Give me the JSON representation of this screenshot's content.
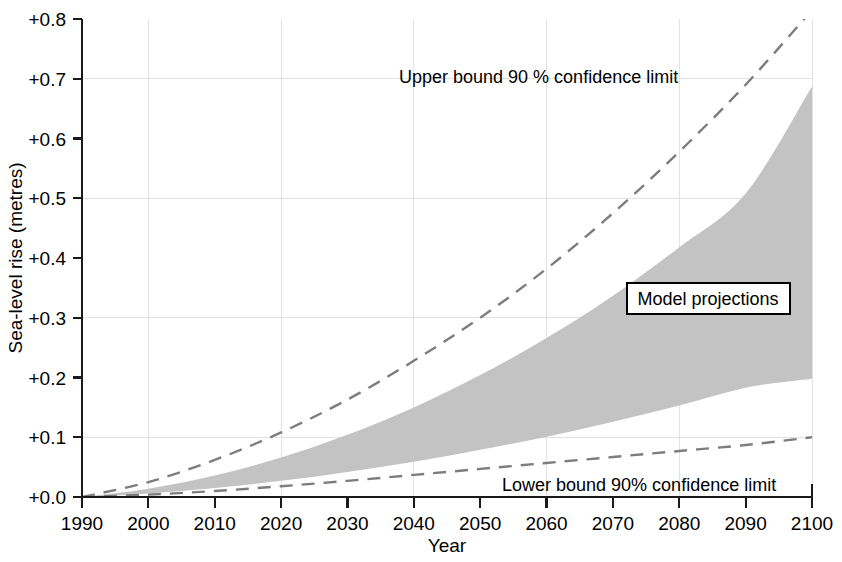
{
  "chart_data": {
    "type": "area",
    "title": "",
    "xlabel": "Year",
    "ylabel": "Sea-level rise (metres)",
    "xlim": [
      1990,
      2100
    ],
    "ylim": [
      0.0,
      0.8
    ],
    "grid": true,
    "legend_position": "inline-annotations",
    "x_tick_labels": [
      "1990",
      "2000",
      "2010",
      "2020",
      "2030",
      "2040",
      "2050",
      "2060",
      "2070",
      "2080",
      "2090",
      "2100"
    ],
    "y_tick_labels": [
      "+0.0",
      "+0.1",
      "+0.2",
      "+0.3",
      "+0.4",
      "+0.5",
      "+0.6",
      "+0.7",
      "+0.8"
    ],
    "x_ticks": [
      1990,
      2000,
      2010,
      2020,
      2030,
      2040,
      2050,
      2060,
      2070,
      2080,
      2090,
      2100
    ],
    "y_ticks": [
      0.0,
      0.1,
      0.2,
      0.3,
      0.4,
      0.5,
      0.6,
      0.7,
      0.8
    ],
    "x_gridlines": [
      1990,
      2000,
      2020,
      2040,
      2060,
      2080,
      2100
    ],
    "y_gridlines": [
      0.1,
      0.3,
      0.5,
      0.7
    ],
    "x": [
      1990,
      2000,
      2010,
      2020,
      2030,
      2040,
      2050,
      2060,
      2070,
      2080,
      2090,
      2100
    ],
    "series": [
      {
        "name": "Upper bound 90 % confidence limit",
        "style": "dashed",
        "values": [
          0.0,
          0.025,
          0.062,
          0.108,
          0.163,
          0.228,
          0.3,
          0.382,
          0.475,
          0.578,
          0.69,
          0.815
        ]
      },
      {
        "name": "Model projections upper envelope",
        "style": "shaded-band-top",
        "values": [
          0.0,
          0.014,
          0.036,
          0.066,
          0.104,
          0.15,
          0.204,
          0.266,
          0.337,
          0.418,
          0.508,
          0.687
        ]
      },
      {
        "name": "Model projections lower envelope",
        "style": "shaded-band-bottom",
        "values": [
          0.0,
          0.006,
          0.015,
          0.027,
          0.042,
          0.059,
          0.079,
          0.101,
          0.126,
          0.153,
          0.183,
          0.198
        ]
      },
      {
        "name": "Lower bound 90% confidence limit",
        "style": "dashed",
        "values": [
          0.0,
          0.004,
          0.01,
          0.018,
          0.027,
          0.037,
          0.047,
          0.057,
          0.067,
          0.077,
          0.087,
          0.1
        ]
      }
    ],
    "annotations": [
      {
        "name": "upper-bound-annotation",
        "text": "Upper bound 90 %  confidence limit",
        "x_px": 399,
        "y_px": 83
      },
      {
        "name": "lower-bound-annotation",
        "text": "Lower bound 90%  confidence limit",
        "x_px": 502,
        "y_px": 491
      }
    ],
    "boxed_label": {
      "name": "model-projections-label",
      "text": "Model projections",
      "x_px": 627,
      "y_px": 283,
      "width_px": 163,
      "height_px": 31
    },
    "colors": {
      "band_fill": "#c3c3c3",
      "bound_line": "#7d7d7d",
      "axis": "#1a1a1a",
      "grid": "#e2e2e2",
      "background": "#ffffff",
      "text": "#000000"
    }
  }
}
